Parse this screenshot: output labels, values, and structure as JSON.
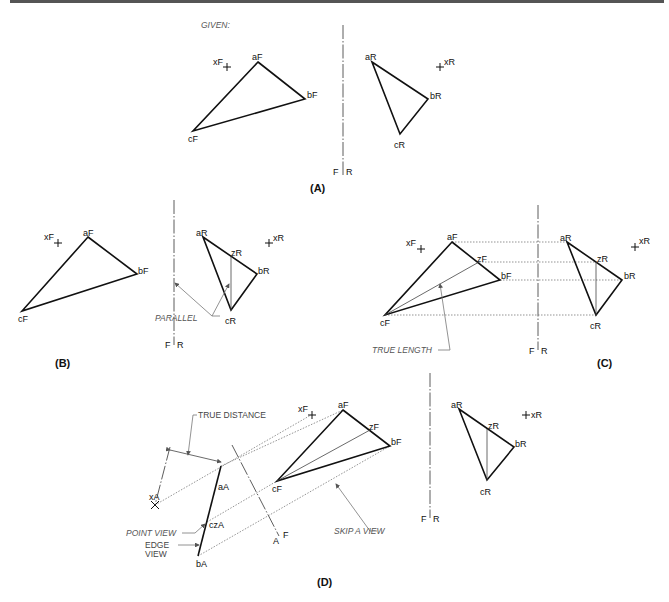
{
  "figure": {
    "given_label": "GIVEN:",
    "panels": {
      "A": {
        "caption": "(A)",
        "front": {
          "a": "aF",
          "b": "bF",
          "c": "cF",
          "x": "xF"
        },
        "right": {
          "a": "aR",
          "b": "bR",
          "c": "cR",
          "x": "xR"
        },
        "fold": {
          "left": "F",
          "right": "R"
        }
      },
      "B": {
        "caption": "(B)",
        "front": {
          "a": "aF",
          "b": "bF",
          "c": "cF",
          "x": "xF"
        },
        "right": {
          "a": "aR",
          "b": "bR",
          "c": "cR",
          "x": "xR",
          "z": "zR"
        },
        "fold": {
          "left": "F",
          "right": "R"
        },
        "note": "PARALLEL"
      },
      "C": {
        "caption": "(C)",
        "front": {
          "a": "aF",
          "b": "bF",
          "c": "cF",
          "x": "xF",
          "z": "zF"
        },
        "right": {
          "a": "aR",
          "b": "bR",
          "c": "cR",
          "x": "xR",
          "z": "zR"
        },
        "fold": {
          "left": "F",
          "right": "R"
        },
        "note": "TRUE LENGTH"
      },
      "D": {
        "caption": "(D)",
        "front": {
          "a": "aF",
          "b": "bF",
          "c": "cF",
          "x": "xF",
          "z": "zF"
        },
        "right": {
          "a": "aR",
          "b": "bR",
          "c": "cR",
          "x": "xR",
          "z": "zR"
        },
        "aux": {
          "a": "aA",
          "b": "bA",
          "cz": "czA",
          "x": "xA"
        },
        "fold_fr": {
          "left": "F",
          "right": "R"
        },
        "fold_af": {
          "left": "A",
          "right": "F"
        },
        "notes": {
          "true_distance": "TRUE DISTANCE",
          "point_view": "POINT VIEW",
          "edge_view_1": "EDGE",
          "edge_view_2": "VIEW",
          "skip_a_view": "SKIP A VIEW"
        }
      }
    }
  }
}
